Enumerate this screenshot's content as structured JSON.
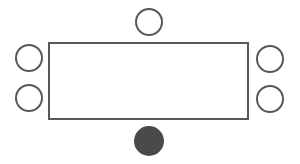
{
  "diagram": {
    "type": "seating-arrangement",
    "stroke_color": "#585858",
    "fill_highlight": "#4a4a4a",
    "background": "#ffffff",
    "table": {
      "shape": "rectangle",
      "x": 49,
      "y": 43,
      "width": 199,
      "height": 76
    },
    "seats": [
      {
        "id": "top",
        "cx": 149,
        "cy": 22,
        "r": 13,
        "filled": false
      },
      {
        "id": "left-upper",
        "cx": 29,
        "cy": 58,
        "r": 13,
        "filled": false
      },
      {
        "id": "left-lower",
        "cx": 29,
        "cy": 98,
        "r": 13,
        "filled": false
      },
      {
        "id": "right-upper",
        "cx": 270,
        "cy": 59,
        "r": 13,
        "filled": false
      },
      {
        "id": "right-lower",
        "cx": 270,
        "cy": 99,
        "r": 13,
        "filled": false
      },
      {
        "id": "bottom",
        "cx": 149,
        "cy": 141,
        "r": 14,
        "filled": true
      }
    ]
  }
}
